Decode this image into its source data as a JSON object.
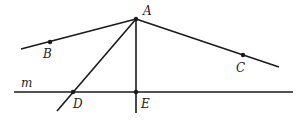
{
  "diagram": {
    "points": [
      {
        "name": "A",
        "x": 136,
        "y": 19,
        "label_x": 143,
        "label_y": 15
      },
      {
        "name": "B",
        "x": 50,
        "y": 42,
        "label_x": 43,
        "label_y": 58
      },
      {
        "name": "C",
        "x": 243,
        "y": 55,
        "label_x": 236,
        "label_y": 72
      },
      {
        "name": "D",
        "x": 73,
        "y": 92,
        "label_x": 73,
        "label_y": 108
      },
      {
        "name": "E",
        "x": 136,
        "y": 92,
        "label_x": 141,
        "label_y": 108
      }
    ],
    "line_label": {
      "name": "m",
      "x": 21,
      "y": 87
    },
    "colors": {
      "stroke": "#1a1a1a",
      "background": "#ffffff"
    }
  }
}
